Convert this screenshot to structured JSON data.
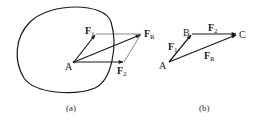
{
  "figure_a": {
    "caption": "(a)",
    "point_label": "A",
    "forces": [
      {
        "symbol": "F",
        "subscript": "1"
      },
      {
        "symbol": "F",
        "subscript": "2"
      },
      {
        "symbol": "F",
        "subscript": "R"
      }
    ]
  },
  "figure_b": {
    "caption": "(b)",
    "points": [
      "A",
      "B",
      "C"
    ],
    "forces": [
      {
        "symbol": "F",
        "subscript": "1"
      },
      {
        "symbol": "F",
        "subscript": "2"
      },
      {
        "symbol": "F",
        "subscript": "R"
      }
    ]
  },
  "colors": {
    "stroke": "#1a1a1a",
    "thin_stroke": "#555555"
  }
}
